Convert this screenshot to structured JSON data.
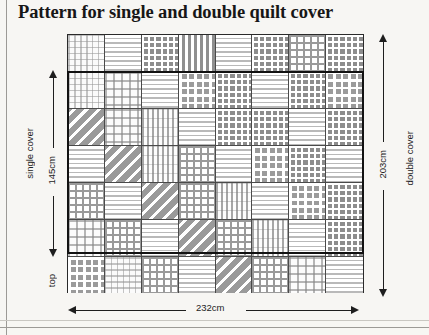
{
  "title": "Pattern for single and double quilt cover",
  "measurements": {
    "single_cover_label": "single cover",
    "single_cover_height": "145cm",
    "double_cover_label": "double cover",
    "double_cover_height": "203cm",
    "width": "232cm",
    "top_label": "top"
  },
  "quilt": {
    "columns": 8,
    "rows": 7,
    "patch_patterns": [
      [
        "plaid-light",
        "hstripe",
        "grid-dark",
        "vstripe",
        "hstripe",
        "grid-dark",
        "grid-med",
        "grid-dark"
      ],
      [
        "plaid-light",
        "plaid-light2",
        "hstripe",
        "grid-dark2",
        "grid-dark",
        "hstripe",
        "grid-dark",
        "grid-dark2"
      ],
      [
        "diag",
        "plaid-light2",
        "vplaid",
        "hstripe",
        "grid-dark",
        "grid-dark",
        "hstripe",
        "grid-dark"
      ],
      [
        "hstripe",
        "diag",
        "vplaid",
        "grid-med",
        "hstripe",
        "grid-dark2",
        "grid-dark",
        "hstripe"
      ],
      [
        "grid-med",
        "hstripe",
        "diag",
        "grid-med",
        "vplaid",
        "hstripe",
        "grid-dark2",
        "grid-dark"
      ],
      [
        "plaid-light2",
        "grid-med",
        "hstripe",
        "diag",
        "grid-med",
        "vplaid",
        "hstripe",
        "grid-dark"
      ],
      [
        "grid-dark2",
        "plaid-light",
        "grid-med",
        "hstripe",
        "diag",
        "grid-med",
        "plaid-light2",
        "hstripe"
      ]
    ]
  },
  "colors": {
    "ink": "#1e1e1e",
    "page": "#f7f6f3",
    "patch_dark": "#8d8d8d",
    "patch_light": "#ffffff"
  }
}
